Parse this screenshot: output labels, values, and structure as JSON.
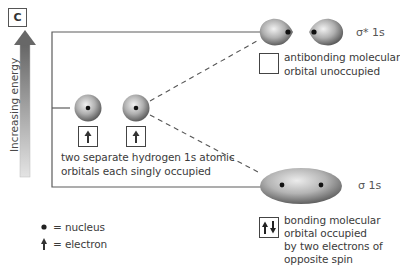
{
  "panel_label": "c",
  "axis": {
    "label": "Increasing energy"
  },
  "atomic_orbitals": {
    "description_line1": "two separate hydrogen 1s atomic",
    "description_line2": "orbitals each singly occupied",
    "electrons": [
      "up",
      "up"
    ]
  },
  "antibonding": {
    "symbol": "σ* 1s",
    "description_line1": "antibonding molecular",
    "description_line2": "orbital unoccupied",
    "electrons": []
  },
  "bonding": {
    "symbol": "σ 1s",
    "description_line1": "bonding molecular",
    "description_line2": "orbital occupied",
    "description_line3": "by two electrons of",
    "description_line4": "opposite spin",
    "electrons": [
      "up",
      "down"
    ]
  },
  "legend": {
    "nucleus_label": "= nucleus",
    "electron_label": "= electron"
  },
  "colors": {
    "orbital_dark": "#6e6e6e",
    "orbital_light": "#e6e6e6",
    "line": "#555555",
    "arrow_top": "#6a6a6a",
    "arrow_bottom": "#e2e2e2"
  }
}
